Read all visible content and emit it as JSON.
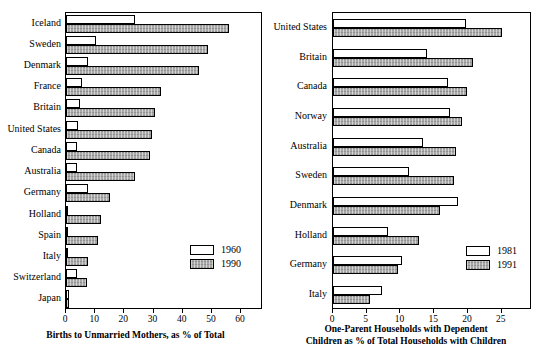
{
  "chart_data": [
    {
      "type": "bar",
      "orientation": "horizontal",
      "panel": "left",
      "title": "",
      "xlabel": "Births to Unmarried Mothers, as % of Total",
      "ylabel": "",
      "xlim": [
        0,
        67.5
      ],
      "xticks": [
        0,
        10,
        20,
        30,
        40,
        50,
        60
      ],
      "xticklabels": [
        "0",
        "10",
        "20",
        "30",
        "40",
        "50",
        "60"
      ],
      "grid": false,
      "legend_position": "lower right",
      "categories": [
        "Iceland",
        "Sweden",
        "Denmark",
        "France",
        "Britain",
        "United States",
        "Canada",
        "Australia",
        "Germany",
        "Holland",
        "Spain",
        "Italy",
        "Switzerland",
        "Japan"
      ],
      "series": [
        {
          "name": "1960",
          "values": [
            23.6,
            10.2,
            7.4,
            5.6,
            4.7,
            4.1,
            3.9,
            3.7,
            7.4,
            0.5,
            0.2,
            0.7,
            3.9,
            1.0
          ]
        },
        {
          "name": "1990",
          "values": [
            55.7,
            48.8,
            45.5,
            32.5,
            30.6,
            29.3,
            28.8,
            23.8,
            15.1,
            11.9,
            10.8,
            7.4,
            7.1,
            1.1
          ]
        }
      ]
    },
    {
      "type": "bar",
      "orientation": "horizontal",
      "panel": "right",
      "title": "",
      "xlabel": "One-Parent Households with Dependent Children as % of Total Households with Children",
      "xlabel_line1": "One-Parent Households with Dependent",
      "xlabel_line2": "Children as % of Total Households with Children",
      "ylabel": "",
      "xlim": [
        0,
        29.5
      ],
      "xticks": [
        0,
        5,
        10,
        15,
        20,
        25
      ],
      "xticklabels": [
        "0",
        "5",
        "10",
        "15",
        "20",
        "25"
      ],
      "grid": false,
      "legend_position": "lower right",
      "categories": [
        "United States",
        "Britain",
        "Canada",
        "Norway",
        "Australia",
        "Sweden",
        "Denmark",
        "Holland",
        "Germany",
        "Italy"
      ],
      "series": [
        {
          "name": "1981",
          "values": [
            19.7,
            14.0,
            17.0,
            17.4,
            13.3,
            11.3,
            18.5,
            8.2,
            10.3,
            7.2
          ]
        },
        {
          "name": "1991",
          "values": [
            25.1,
            20.8,
            19.8,
            19.1,
            18.3,
            18.0,
            15.9,
            12.7,
            9.7,
            5.5
          ]
        }
      ]
    }
  ],
  "colors": {
    "series0_fill": "#ffffff",
    "series1_fill": "#a8a8a8",
    "outline": "#000000",
    "background": "#ffffff"
  }
}
